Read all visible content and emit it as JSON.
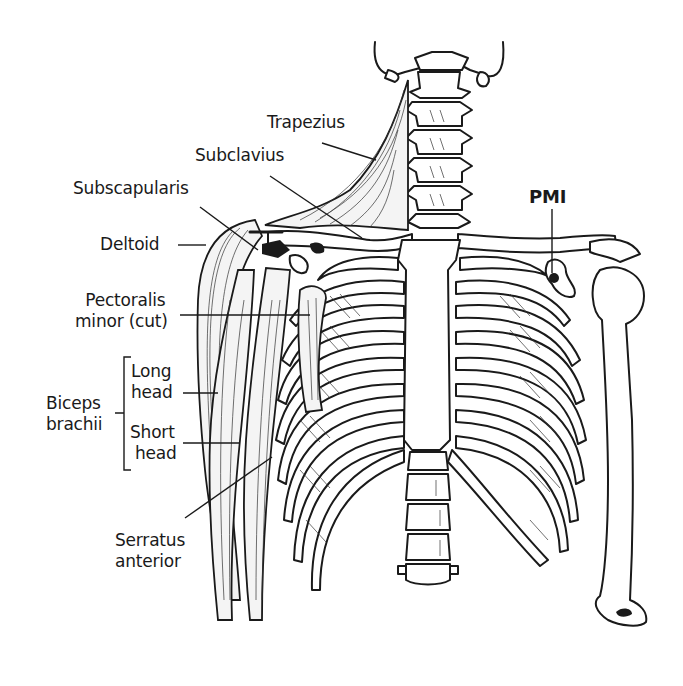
{
  "figure": {
    "labels": {
      "trapezius": "Trapezius",
      "subclavius": "Subclavius",
      "subscapularis": "Subscapularis",
      "deltoid": "Deltoid",
      "pectoralis_minor_line1": "Pectoralis",
      "pectoralis_minor_line2": "minor (cut)",
      "biceps_line1": "Biceps",
      "biceps_line2": "brachii",
      "long_head_line1": "Long",
      "long_head_line2": "head",
      "short_head_line1": "Short",
      "short_head_line2": "head",
      "serratus_line1": "Serratus",
      "serratus_line2": "anterior",
      "pmi": "PMI"
    }
  }
}
